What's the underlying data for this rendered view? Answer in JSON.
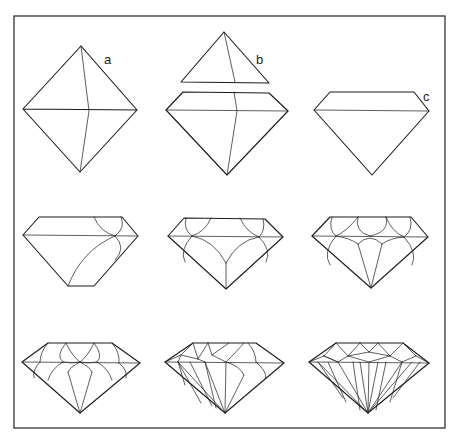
{
  "figure": {
    "frame": {
      "x": 14,
      "y": 16,
      "w": 431,
      "h": 412
    },
    "stroke_color": "#1a1a1a",
    "background": "#ffffff"
  },
  "labels": {
    "a": {
      "text": "a",
      "x": 104,
      "y": 64
    },
    "b": {
      "text": "b",
      "x": 256,
      "y": 64
    },
    "c": {
      "text": "c",
      "x": 423,
      "y": 101
    }
  },
  "stages": [
    {
      "id": "stage-1-octahedron",
      "label": "a",
      "outline": "81,46 23,109 137,110 81,46 M23,109 80,172 137,110",
      "facets": "M81,46 89,111 80,172"
    },
    {
      "id": "stage-2-sawn",
      "label": "b",
      "outline": "M224,32 181,82 269,83 Z M183,92 269,93 288,111 227,175 166,110 Z",
      "facets": "M224,32 235,82 M234,92 237,111 227,175 M166,110 288,111"
    },
    {
      "id": "stage-3-table",
      "label": "c",
      "outline": "M330,92 414,92 429,111 372,175 314,110 Z",
      "facets": "M314,110 429,111"
    },
    {
      "id": "stage-4-first-facets",
      "label": "",
      "outline": "M39,217 122,217 138,236 94,286 68,286 23,235 Z",
      "facets": "M23,235 138,236 M94,217 Q100,232 115,236 M121,217 Q126,228 115,236 M115,236 Q127,248 115,260 M115,236 Q82,250 68,286"
    },
    {
      "id": "stage-5-more-facets",
      "label": "",
      "outline": "M184,218 265,219 283,237 226,289 168,236 Z",
      "facets": "M168,236 283,237 M186,218 Q183,230 192,236 M211,218 Q205,232 192,236 M240,218 Q246,232 259,237 M263,219 Q266,230 259,237 M192,236 Q179,250 185,262 M192,236 Q214,240 226,263 M259,237 Q238,240 226,263 M259,237 Q272,250 266,262 M226,263 226,289"
    },
    {
      "id": "stage-6-pavilion-mains",
      "label": "",
      "outline": "M330,217 411,217 428,237 371,288 312,236 Z",
      "facets": "M312,236 428,237 M332,217 Q328,230 336,236 M358,217 Q346,232 336,236 M358,217 Q354,232 370,236 M386,217 Q390,232 370,236 M386,217 Q392,232 404,237 M410,217 Q414,230 404,237 M336,236 Q322,252 330,265 M336,236 Q350,238 358,244 M404,237 Q390,238 382,244 M404,237 Q418,252 412,265 M358,244 Q370,232 382,244 M358,244 371,288 M382,244 371,288"
    },
    {
      "id": "stage-7-stars-upper",
      "label": "",
      "outline": "M48,343 112,343 140,363 80,413 22,362 Z",
      "facets": "M22,362 140,363 M48,343 Q40,352 40,362 M66,343 Q55,356 63,362 M66,343 Q72,356 80,362 M94,343 Q88,356 80,362 M94,343 Q104,356 97,362 M112,343 Q120,352 119,363 M40,362 Q32,370 34,378 M63,362 Q52,368 48,380 M63,362 Q72,364 80,362 M97,362 Q88,364 80,362 M97,362 Q108,368 112,380 M119,363 Q128,370 126,378 M80,362 Q70,367 68,372 M80,362 Q90,367 92,372 M68,372 80,413 M92,372 80,413"
    },
    {
      "id": "stage-8-partial-brilliant",
      "label": "",
      "outline": "M193,343 256,343 284,363 225,413 165,362 Z",
      "facets": "M165,362 284,363 M193,343 181,355 165,362 M181,355 178,362 M193,343 198,359 M198,359 208,343 M208,343 212,355 M212,355 229,343 M212,355 226,362 M181,355 198,359 M198,359 205,362 M226,362 Q238,350 244,343 M248,343 Q256,352 256,362 M256,362 Q266,370 266,378 M226,362 Q240,366 244,375 M178,362 201,403 M178,362 185,385 M190,362 212,406 M205,362 225,413 M205,362 216,408 M226,362 225,413 M178,362 225,413 M244,375 225,413"
    },
    {
      "id": "stage-9-finished-brilliant",
      "label": "",
      "outline": "M336,343 403,343 429,363 368,413 309,362 Z",
      "facets": "M309,362 429,363 M336,343 324,356 M324,356 309,362 M324,356 338,362 M336,343 348,356 M348,356 360,343 M360,343 369,352 M369,352 378,343 M378,343 390,356 M390,356 403,343 M403,343 416,356 M416,356 429,363 M416,356 402,362 M324,356 338,362 M348,356 369,362 M369,352 348,356 M369,352 390,356 M390,356 369,362 M390,356 402,362 M348,356 338,362 M318,362 343,398 M318,362 368,413 M328,362 346,402 M338,362 368,413 M353,362 360,410 M360,362 368,413 M369,362 368,413 M378,362 368,413 M386,362 376,410 M402,362 368,413 M402,362 390,402 M412,362 368,413 M420,362 393,398"
    }
  ]
}
